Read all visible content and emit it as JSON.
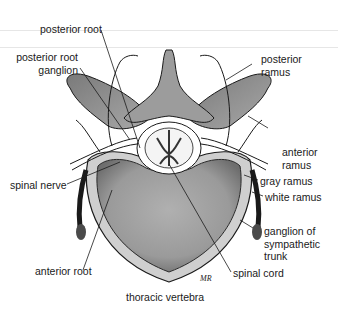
{
  "diagram": {
    "caption": "thoracic vertebra",
    "artist_mark": "MR",
    "labels": {
      "posterior_root": "posterior root",
      "posterior_root_ganglion_1": "posterior root",
      "posterior_root_ganglion_2": "ganglion",
      "posterior_ramus_1": "posterior",
      "posterior_ramus_2": "ramus",
      "anterior_ramus_1": "anterior",
      "anterior_ramus_2": "ramus",
      "spinal_nerve": "spinal nerve",
      "gray_ramus": "gray ramus",
      "white_ramus": "white ramus",
      "ganglion_sympathetic_1": "ganglion of",
      "ganglion_sympathetic_2": "sympathetic",
      "ganglion_sympathetic_3": "trunk",
      "anterior_root": "anterior root",
      "spinal_cord": "spinal cord"
    },
    "colors": {
      "bone_dark": "#8a8a8a",
      "bone_mid": "#b3b3b3",
      "bone_light": "#d4d4d4",
      "outline": "#1a1a1a",
      "background": "#ffffff"
    }
  }
}
